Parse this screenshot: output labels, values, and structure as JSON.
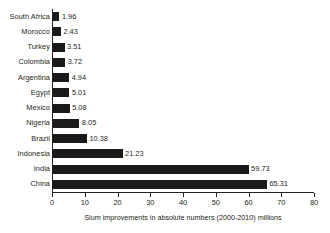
{
  "chart_data": {
    "type": "bar",
    "orientation": "horizontal",
    "title": "",
    "xlabel": "Slum improvements in absolute numbers (2000-2010) millions",
    "ylabel": "",
    "xlim": [
      0,
      80
    ],
    "xticks": [
      0,
      10,
      20,
      30,
      40,
      50,
      60,
      70,
      80
    ],
    "grid": false,
    "legend": false,
    "bar_color": "#1a1a1a",
    "background_color": "#ffffff",
    "text_color": "#231f20",
    "categories": [
      "South Africa",
      "Morocco",
      "Turkey",
      "Colombia",
      "Argentina",
      "Egypt",
      "Mexico",
      "Nigeria",
      "Brazil",
      "Indonesia",
      "India",
      "China"
    ],
    "values": [
      1.96,
      2.43,
      3.51,
      3.72,
      4.94,
      5.01,
      5.08,
      8.05,
      10.38,
      21.23,
      59.73,
      65.31
    ],
    "value_labels": [
      "1.96",
      "2.43",
      "3.51",
      "3.72",
      "4.94",
      "5.01",
      "5.08",
      "8.05",
      "10.38",
      "21.23",
      "59.73",
      "65.31"
    ]
  }
}
